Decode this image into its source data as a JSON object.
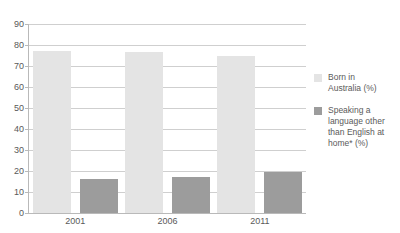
{
  "chart_data": {
    "type": "bar",
    "title": "",
    "subtitle": "",
    "xlabel": "",
    "ylabel": "",
    "categories": [
      "2001",
      "2006",
      "2011"
    ],
    "series": [
      {
        "name": "Born in Australia (%)",
        "color": "#e4e4e4",
        "values": [
          77,
          76.5,
          75
        ]
      },
      {
        "name": "Speaking a language other than English at home* (%)",
        "color": "#9c9c9c",
        "values": [
          16,
          17,
          19.5
        ]
      }
    ],
    "ylim": [
      0,
      90
    ],
    "yticks": [
      0,
      10,
      20,
      30,
      40,
      50,
      60,
      70,
      80,
      90
    ],
    "ytick_labels": [
      "0",
      "10",
      "20",
      "30",
      "40",
      "50",
      "60",
      "70",
      "80",
      "90"
    ],
    "grid": true,
    "legend_position": "right",
    "legend_entries": [
      "Born in Australia (%)",
      "Speaking a language other than English at home* (%)"
    ],
    "annotations": []
  },
  "legend": {
    "items": [
      {
        "label_line1": "Born in",
        "label_line2": "Australia (%)"
      },
      {
        "label_line1": "Speaking a",
        "label_line2": "language other",
        "label_line3": "than English at",
        "label_line4": "home* (%)"
      }
    ]
  }
}
